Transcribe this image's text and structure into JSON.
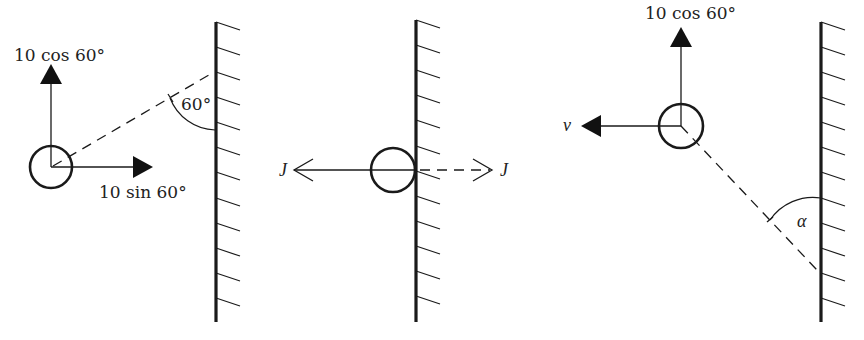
{
  "diagram": {
    "panels": [
      {
        "id": "before-impact",
        "labels": {
          "vertical_component": "10 cos 60°",
          "horizontal_component": "10 sin 60°",
          "angle": "60°"
        },
        "ball": {
          "cx": 51,
          "cy": 167,
          "r": 21
        },
        "wall": {
          "x": 216,
          "y1": 22,
          "y2": 322
        },
        "vectors": [
          {
            "name": "vertical",
            "from": [
              51,
              167
            ],
            "to": [
              51,
              64
            ],
            "head": "filled"
          },
          {
            "name": "horizontal",
            "from": [
              51,
              167
            ],
            "to": [
              153,
              167
            ],
            "head": "filled"
          }
        ],
        "incoming_path": {
          "from": [
            51,
            167
          ],
          "to": [
            214,
            72
          ],
          "style": "dashed"
        }
      },
      {
        "id": "impact",
        "labels": {
          "impulse_left": "J",
          "impulse_right": "J"
        },
        "ball": {
          "cx": 393,
          "cy": 170,
          "r": 22
        },
        "wall": {
          "x": 416,
          "y1": 20,
          "y2": 322
        },
        "vectors": [
          {
            "name": "impulse-on-ball",
            "from": [
              416,
              170
            ],
            "to": [
              293,
              170
            ],
            "head": "open",
            "style": "solid"
          },
          {
            "name": "impulse-on-wall",
            "from": [
              416,
              170
            ],
            "to": [
              492,
              170
            ],
            "head": "open",
            "style": "dashed"
          }
        ]
      },
      {
        "id": "after-impact",
        "labels": {
          "vertical_component": "10 cos 60°",
          "horizontal_velocity": "v",
          "angle": "α"
        },
        "ball": {
          "cx": 681,
          "cy": 126,
          "r": 22
        },
        "wall": {
          "x": 821,
          "y1": 22,
          "y2": 322
        },
        "vectors": [
          {
            "name": "vertical",
            "from": [
              681,
              126
            ],
            "to": [
              681,
              27
            ],
            "head": "filled"
          },
          {
            "name": "horizontal",
            "from": [
              681,
              126
            ],
            "to": [
              581,
              126
            ],
            "head": "filled"
          }
        ],
        "outgoing_path": {
          "from": [
            681,
            126
          ],
          "to": [
            817,
            270
          ],
          "style": "dashed"
        }
      }
    ],
    "colors": {
      "ink": "#1a1a1a",
      "background": "#ffffff"
    }
  }
}
